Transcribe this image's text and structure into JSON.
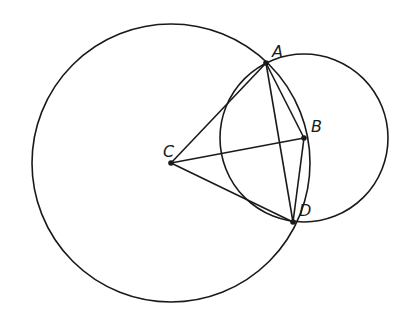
{
  "diagram": {
    "type": "geometry",
    "colors": {
      "stroke": "#1a1a1a",
      "background": "#ffffff"
    },
    "points": {
      "A": {
        "label": "A",
        "x": 266,
        "y": 63
      },
      "B": {
        "label": "B",
        "x": 304,
        "y": 138
      },
      "C": {
        "label": "C",
        "x": 171,
        "y": 163
      },
      "D": {
        "label": "D",
        "x": 293,
        "y": 222
      }
    },
    "circles": [
      {
        "name": "circle-centered-C",
        "center": "C",
        "r": 139
      },
      {
        "name": "circle-centered-B",
        "center": "B",
        "r": 84
      }
    ],
    "segments": [
      [
        "C",
        "A"
      ],
      [
        "C",
        "B"
      ],
      [
        "C",
        "D"
      ],
      [
        "A",
        "B"
      ],
      [
        "B",
        "D"
      ],
      [
        "A",
        "D"
      ]
    ],
    "labels": {
      "A": {
        "text": "A",
        "x": 272,
        "y": 57
      },
      "B": {
        "text": "B",
        "x": 311,
        "y": 132
      },
      "C": {
        "text": "C",
        "x": 163,
        "y": 157
      },
      "D": {
        "text": "D",
        "x": 299,
        "y": 216
      }
    }
  }
}
